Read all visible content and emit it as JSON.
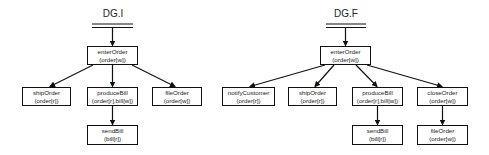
{
  "diagrams": [
    {
      "title": "DG.I",
      "nodes": {
        "enterOrder": {
          "name": "enterOrder",
          "access": "(order[w])"
        },
        "shipOrder": {
          "name": "shipOrder",
          "access": "(order[r])"
        },
        "produceBill": {
          "name": "produceBill",
          "access": "(order[r],bill[w])"
        },
        "fileOrder": {
          "name": "fileOrder",
          "access": "(order[w])"
        },
        "sendBill": {
          "name": "sendBill",
          "access": "(bill[r])"
        }
      },
      "edges": [
        [
          "start",
          "enterOrder"
        ],
        [
          "enterOrder",
          "shipOrder"
        ],
        [
          "enterOrder",
          "produceBill"
        ],
        [
          "enterOrder",
          "fileOrder"
        ],
        [
          "produceBill",
          "sendBill"
        ]
      ]
    },
    {
      "title": "DG.F",
      "nodes": {
        "enterOrder": {
          "name": "enterOrder",
          "access": "(order[w])"
        },
        "notifyCustomer": {
          "name": "notifyCustomer",
          "access": "(order[r])"
        },
        "shipOrder": {
          "name": "shipOrder",
          "access": "(order[r])"
        },
        "produceBill": {
          "name": "produceBill",
          "access": "(order[r],bill[w])"
        },
        "closeOrder": {
          "name": "closeOrder",
          "access": "(order[w])"
        },
        "sendBill": {
          "name": "sendBill",
          "access": "(bill[r])"
        },
        "fileOrder": {
          "name": "fileOrder",
          "access": "(order[w])"
        }
      },
      "edges": [
        [
          "start",
          "enterOrder"
        ],
        [
          "enterOrder",
          "notifyCustomer"
        ],
        [
          "enterOrder",
          "shipOrder"
        ],
        [
          "enterOrder",
          "produceBill"
        ],
        [
          "enterOrder",
          "closeOrder"
        ],
        [
          "produceBill",
          "sendBill"
        ],
        [
          "closeOrder",
          "fileOrder"
        ]
      ]
    }
  ]
}
